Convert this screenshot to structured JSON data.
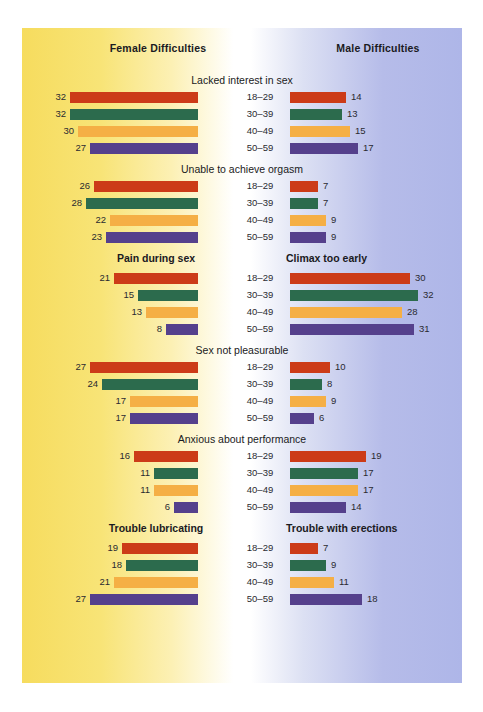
{
  "headers": {
    "female": "Female Difficulties",
    "male": "Male Difficulties"
  },
  "colors": {
    "red": "#CC3B18",
    "green": "#2C6B4D",
    "orange": "#F5AF45",
    "purple": "#55408C",
    "bg_left": "#F6DC5E",
    "bg_center": "#FFFFFF",
    "bg_right": "#AEB6E8",
    "text": "#1a1a22"
  },
  "age_groups": [
    "18–29",
    "30–39",
    "40–49",
    "50–59"
  ],
  "chart_data": {
    "type": "bar",
    "xlabel": "",
    "ylabel": "",
    "categories": [
      "18–29",
      "30–39",
      "40–49",
      "50–59"
    ],
    "legend": [
      "Female Difficulties",
      "Male Difficulties"
    ],
    "orientation": "horizontal-bidirectional",
    "units": "percent",
    "px_per_unit": 4,
    "sections": [
      {
        "title_mode": "center",
        "title_center": "Lacked interest in sex",
        "title_left": "Lacked interest in sex",
        "title_right": "Lacked interest in sex",
        "female": [
          32,
          32,
          30,
          27
        ],
        "male": [
          14,
          13,
          15,
          17
        ]
      },
      {
        "title_mode": "center",
        "title_center": "Unable to achieve orgasm",
        "title_left": "Unable to achieve orgasm",
        "title_right": "Unable to achieve orgasm",
        "female": [
          26,
          28,
          22,
          23
        ],
        "male": [
          7,
          7,
          9,
          9
        ]
      },
      {
        "title_mode": "pair",
        "title_center": "",
        "title_left": "Pain during sex",
        "title_right": "Climax too early",
        "female": [
          21,
          15,
          13,
          8
        ],
        "male": [
          30,
          32,
          28,
          31
        ]
      },
      {
        "title_mode": "center",
        "title_center": "Sex not pleasurable",
        "title_left": "Sex not pleasurable",
        "title_right": "Sex not pleasurable",
        "female": [
          27,
          24,
          17,
          17
        ],
        "male": [
          10,
          8,
          9,
          6
        ]
      },
      {
        "title_mode": "center",
        "title_center": "Anxious about performance",
        "title_left": "Anxious about performance",
        "title_right": "Anxious about performance",
        "female": [
          16,
          11,
          11,
          6
        ],
        "male": [
          19,
          17,
          17,
          14
        ]
      },
      {
        "title_mode": "pair",
        "title_center": "",
        "title_left": "Trouble lubricating",
        "title_right": "Trouble with erections",
        "female": [
          19,
          18,
          21,
          27
        ],
        "male": [
          7,
          9,
          11,
          18
        ]
      }
    ]
  }
}
